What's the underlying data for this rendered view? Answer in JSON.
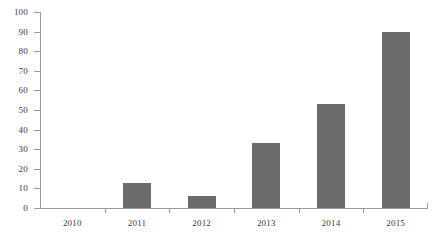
{
  "chart_data": {
    "type": "bar",
    "title": "",
    "subtitle": "",
    "xlabel": "",
    "ylabel": "",
    "categories": [
      "2010",
      "2011",
      "2012",
      "2013",
      "2014",
      "2015"
    ],
    "values": [
      0,
      13,
      6,
      33,
      53,
      90
    ],
    "series": [
      {
        "name": "",
        "values": [
          0,
          13,
          6,
          33,
          53,
          90
        ]
      }
    ],
    "ylim": [
      0,
      100
    ],
    "y_ticks": [
      0,
      10,
      20,
      30,
      40,
      50,
      60,
      70,
      80,
      90,
      100
    ],
    "y_tick_labels": [
      "0",
      "10",
      "20",
      "30",
      "40",
      "50",
      "60",
      "70",
      "80",
      "90",
      "100"
    ],
    "grid": false,
    "legend": false,
    "legend_position": "none",
    "bar_color": "#6b6b6b",
    "axis_color": "#9a9a9a",
    "text_color": "#3a3a3a",
    "background": "#ffffff"
  }
}
